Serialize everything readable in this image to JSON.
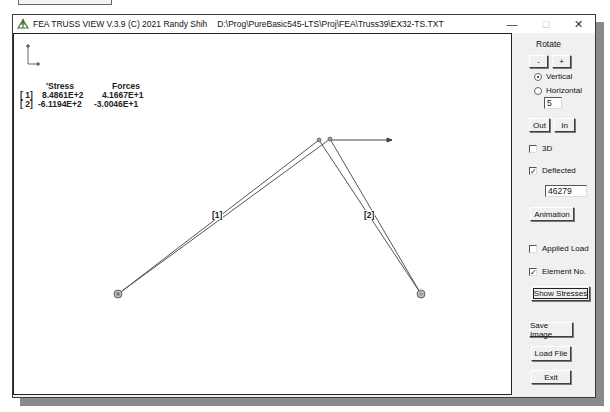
{
  "window": {
    "title": "FEA TRUSS VIEW V.3.9 (C) 2021 Randy Shih",
    "file_path": "D:\\Prog\\PureBasic545-LTS\\Proj\\FEA\\Truss39\\EX32-TS.TXT",
    "controls": {
      "minimize": "—",
      "maximize": "□",
      "close": "✕"
    }
  },
  "results": {
    "headers": {
      "stress": "'Stress",
      "forces": "Forces"
    },
    "rows": [
      {
        "id": "[ 1]",
        "stress": "8.4861E+2",
        "force": "4.1667E+1"
      },
      {
        "id": "[ 2]",
        "stress": "-6.1194E+2",
        "force": "-3.0046E+1"
      }
    ]
  },
  "truss": {
    "element_labels": [
      "[1]",
      "[2]"
    ],
    "nodes": [
      {
        "id": 1,
        "x": 104,
        "y": 260
      },
      {
        "id": 2,
        "x": 305,
        "y": 106
      },
      {
        "id": 3,
        "x": 407,
        "y": 260
      }
    ],
    "deflected_top": {
      "x": 316,
      "y": 105
    },
    "load_arrow": {
      "x1": 316,
      "y1": 106,
      "x2": 378,
      "y2": 106
    },
    "line_color": "#555555"
  },
  "panel": {
    "rotate_label": "Rotate",
    "rotate_minus": "-",
    "rotate_plus": "+",
    "radio_vertical": "Vertical",
    "radio_horizontal": "Horizontal",
    "rotate_step": "5",
    "zoom_out": "Out",
    "zoom_in": "In",
    "check_3d": "3D",
    "check_3d_state": false,
    "check_deflected": "Deflected",
    "check_deflected_state": true,
    "deflection_scale": "46279",
    "animation": "Animation",
    "check_applied_load": "Applied Load",
    "check_applied_load_state": false,
    "check_element_no": "Element No.",
    "check_element_no_state": true,
    "show_stresses": "Show Stresses",
    "save_image": "Save Image",
    "load_file": "Load File",
    "exit": "Exit"
  }
}
